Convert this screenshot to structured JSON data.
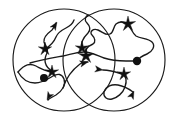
{
  "figure": {
    "width": 177,
    "height": 121,
    "background_color": "#ffffff",
    "stroke_color": "#1a1a1a",
    "marker_color": "#111111"
  },
  "chart_data": {
    "type": "diagram",
    "title": "",
    "xlabel": "",
    "ylabel": "",
    "grid": false,
    "legend": null,
    "regions": [
      {
        "name": "left-circle",
        "shape": "circle",
        "cx": 64,
        "cy": 60,
        "r": 51,
        "stroke": "#1a1a1a",
        "fill": "none"
      },
      {
        "name": "right-circle",
        "shape": "circle",
        "cx": 114,
        "cy": 60,
        "r": 51,
        "stroke": "#1a1a1a",
        "fill": "none"
      }
    ],
    "markers": [
      {
        "name": "star-upper-left",
        "type": "star",
        "x": 45,
        "y": 49,
        "size": 7
      },
      {
        "name": "star-center-upper",
        "type": "star",
        "x": 82,
        "y": 48,
        "size": 7
      },
      {
        "name": "star-center-lower",
        "type": "star",
        "x": 86,
        "y": 56,
        "size": 8
      },
      {
        "name": "star-mid-left",
        "type": "star",
        "x": 52,
        "y": 72,
        "size": 7
      },
      {
        "name": "star-right-upper",
        "type": "star",
        "x": 128,
        "y": 24,
        "size": 8
      },
      {
        "name": "star-right-lower",
        "type": "star",
        "x": 124,
        "y": 74,
        "size": 7
      },
      {
        "name": "dot-left",
        "type": "dot",
        "x": 44,
        "y": 78,
        "size": 4
      },
      {
        "name": "dot-right",
        "type": "dot",
        "x": 137,
        "y": 61,
        "size": 4.2
      }
    ],
    "arrowheads": [
      {
        "name": "arrow-top-left",
        "x": 57,
        "y": 22,
        "angle": -58
      },
      {
        "name": "arrow-bottom-left",
        "x": 47,
        "y": 100,
        "angle": 118
      },
      {
        "name": "arrow-center-up",
        "x": 88,
        "y": 62,
        "angle": -14
      },
      {
        "name": "arrow-center-right",
        "x": 103,
        "y": 70,
        "angle": 8
      },
      {
        "name": "arrow-bottom-right",
        "x": 134,
        "y": 91,
        "angle": -64
      }
    ],
    "trajectory_count": 4
  }
}
